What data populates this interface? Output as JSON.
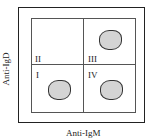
{
  "diagram": {
    "y_axis_label": "Anti-IgD",
    "x_axis_label": "Anti-IgM",
    "quadrants": [
      {
        "id": "I",
        "label": "I",
        "position": "bottom-left",
        "has_population": true
      },
      {
        "id": "II",
        "label": "II",
        "position": "top-left",
        "has_population": false
      },
      {
        "id": "III",
        "label": "III",
        "position": "top-right",
        "has_population": true
      },
      {
        "id": "IV",
        "label": "IV",
        "position": "bottom-right",
        "has_population": true
      }
    ],
    "population_color": "#d4d4d4"
  }
}
